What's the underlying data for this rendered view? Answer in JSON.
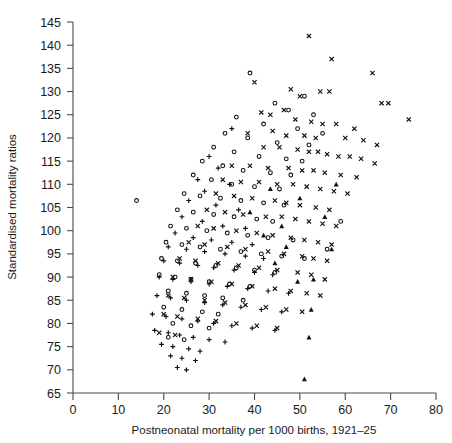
{
  "figure": {
    "clipped_top_caption": "",
    "background": "#ffffff",
    "marker_color": "#111111",
    "axis_color": "#4a4a4a"
  },
  "chart_data": {
    "type": "scatter",
    "title": "",
    "xlabel": "Postneonatal mortality per 1000 births, 1921–25",
    "ylabel": "Standardised mortality ratios",
    "xlim": [
      0,
      80
    ],
    "ylim": [
      65,
      145
    ],
    "xticks": [
      0,
      10,
      20,
      30,
      40,
      50,
      60,
      70,
      80
    ],
    "yticks": [
      65,
      70,
      75,
      80,
      85,
      90,
      95,
      100,
      105,
      110,
      115,
      120,
      125,
      130,
      135,
      140,
      145
    ],
    "grid": false,
    "legend": false,
    "series": [
      {
        "name": "cross",
        "marker": "x",
        "points": [
          [
            52.0,
            142.0
          ],
          [
            57.0,
            137.0
          ],
          [
            40.0,
            132.0
          ],
          [
            66.0,
            134.0
          ],
          [
            48.0,
            130.5
          ],
          [
            54.5,
            130.0
          ],
          [
            56.5,
            130.0
          ],
          [
            50.0,
            129.0
          ],
          [
            68.0,
            127.5
          ],
          [
            69.5,
            127.5
          ],
          [
            74.0,
            124.0
          ],
          [
            46.5,
            126.0
          ],
          [
            41.5,
            125.5
          ],
          [
            43.5,
            125.0
          ],
          [
            49.0,
            124.0
          ],
          [
            52.5,
            123.5
          ],
          [
            55.0,
            123.0
          ],
          [
            58.0,
            123.0
          ],
          [
            62.0,
            122.0
          ],
          [
            44.0,
            121.5
          ],
          [
            38.5,
            121.0
          ],
          [
            47.0,
            120.5
          ],
          [
            51.0,
            120.5
          ],
          [
            53.5,
            120.0
          ],
          [
            60.0,
            120.0
          ],
          [
            64.0,
            119.5
          ],
          [
            67.0,
            118.5
          ],
          [
            42.0,
            118.0
          ],
          [
            45.5,
            118.0
          ],
          [
            49.5,
            117.5
          ],
          [
            52.0,
            117.0
          ],
          [
            54.0,
            117.0
          ],
          [
            56.0,
            116.5
          ],
          [
            58.5,
            116.0
          ],
          [
            61.0,
            116.0
          ],
          [
            63.5,
            115.5
          ],
          [
            66.5,
            114.5
          ],
          [
            35.0,
            114.0
          ],
          [
            39.0,
            114.0
          ],
          [
            43.0,
            113.5
          ],
          [
            47.5,
            113.5
          ],
          [
            50.5,
            113.0
          ],
          [
            53.0,
            113.0
          ],
          [
            55.5,
            112.5
          ],
          [
            59.0,
            112.0
          ],
          [
            62.5,
            111.5
          ],
          [
            33.0,
            111.0
          ],
          [
            37.0,
            110.5
          ],
          [
            41.0,
            110.5
          ],
          [
            45.0,
            110.0
          ],
          [
            48.5,
            110.0
          ],
          [
            51.5,
            109.5
          ],
          [
            54.5,
            109.0
          ],
          [
            57.5,
            108.5
          ],
          [
            60.5,
            108.0
          ],
          [
            31.5,
            108.0
          ],
          [
            35.5,
            107.5
          ],
          [
            39.5,
            107.0
          ],
          [
            44.5,
            106.5
          ],
          [
            47.0,
            106.0
          ],
          [
            50.0,
            105.5
          ],
          [
            53.5,
            105.0
          ],
          [
            56.5,
            104.5
          ],
          [
            29.5,
            104.5
          ],
          [
            33.5,
            104.0
          ],
          [
            37.5,
            103.5
          ],
          [
            42.5,
            103.0
          ],
          [
            46.0,
            103.0
          ],
          [
            49.0,
            102.5
          ],
          [
            52.0,
            102.0
          ],
          [
            55.0,
            101.5
          ],
          [
            58.0,
            101.0
          ],
          [
            27.5,
            101.0
          ],
          [
            31.0,
            100.5
          ],
          [
            36.0,
            100.0
          ],
          [
            40.5,
            99.5
          ],
          [
            44.0,
            99.0
          ],
          [
            48.0,
            98.5
          ],
          [
            51.0,
            98.0
          ],
          [
            54.0,
            97.5
          ],
          [
            57.0,
            97.0
          ],
          [
            25.5,
            97.5
          ],
          [
            29.0,
            97.0
          ],
          [
            34.0,
            96.5
          ],
          [
            38.0,
            96.0
          ],
          [
            43.0,
            95.5
          ],
          [
            46.5,
            95.0
          ],
          [
            50.5,
            94.5
          ],
          [
            53.0,
            94.0
          ],
          [
            56.0,
            93.5
          ],
          [
            23.5,
            94.0
          ],
          [
            27.0,
            93.5
          ],
          [
            32.0,
            93.0
          ],
          [
            36.5,
            92.5
          ],
          [
            41.0,
            92.0
          ],
          [
            45.0,
            91.5
          ],
          [
            49.5,
            91.0
          ],
          [
            52.5,
            90.5
          ],
          [
            55.5,
            89.5
          ],
          [
            22.0,
            90.0
          ],
          [
            26.0,
            89.5
          ],
          [
            30.5,
            89.0
          ],
          [
            35.0,
            88.5
          ],
          [
            39.5,
            88.0
          ],
          [
            44.5,
            87.5
          ],
          [
            48.0,
            87.0
          ],
          [
            51.5,
            86.5
          ],
          [
            54.5,
            86.0
          ],
          [
            21.0,
            86.0
          ],
          [
            24.5,
            85.5
          ],
          [
            29.0,
            85.0
          ],
          [
            33.5,
            84.5
          ],
          [
            38.0,
            84.0
          ],
          [
            42.5,
            83.5
          ],
          [
            47.0,
            83.0
          ],
          [
            50.5,
            82.5
          ],
          [
            20.0,
            82.0
          ],
          [
            23.0,
            81.5
          ],
          [
            27.5,
            81.0
          ],
          [
            31.5,
            80.5
          ],
          [
            36.0,
            80.0
          ],
          [
            40.5,
            79.5
          ],
          [
            45.0,
            79.0
          ],
          [
            19.0,
            78.0
          ],
          [
            22.5,
            77.5
          ]
        ]
      },
      {
        "name": "circle",
        "marker": "o",
        "points": [
          [
            39.0,
            134.0
          ],
          [
            51.0,
            129.0
          ],
          [
            44.5,
            127.5
          ],
          [
            47.5,
            126.0
          ],
          [
            53.0,
            125.0
          ],
          [
            36.0,
            124.5
          ],
          [
            42.0,
            123.0
          ],
          [
            49.5,
            122.0
          ],
          [
            55.0,
            121.0
          ],
          [
            33.5,
            121.0
          ],
          [
            38.5,
            120.0
          ],
          [
            45.0,
            119.0
          ],
          [
            52.0,
            118.5
          ],
          [
            31.0,
            118.0
          ],
          [
            35.5,
            117.0
          ],
          [
            41.0,
            116.0
          ],
          [
            47.0,
            115.5
          ],
          [
            50.5,
            115.0
          ],
          [
            28.5,
            115.0
          ],
          [
            33.0,
            114.0
          ],
          [
            37.5,
            113.0
          ],
          [
            43.5,
            112.5
          ],
          [
            48.0,
            112.0
          ],
          [
            26.5,
            112.0
          ],
          [
            30.5,
            111.0
          ],
          [
            35.0,
            110.0
          ],
          [
            40.0,
            109.5
          ],
          [
            45.5,
            109.0
          ],
          [
            14.0,
            106.5
          ],
          [
            24.5,
            108.0
          ],
          [
            28.0,
            107.5
          ],
          [
            32.5,
            107.0
          ],
          [
            37.0,
            106.5
          ],
          [
            42.0,
            106.0
          ],
          [
            46.5,
            105.5
          ],
          [
            23.0,
            104.5
          ],
          [
            26.5,
            104.0
          ],
          [
            31.0,
            103.5
          ],
          [
            35.5,
            103.0
          ],
          [
            40.5,
            102.5
          ],
          [
            44.0,
            102.0
          ],
          [
            21.5,
            101.0
          ],
          [
            25.0,
            100.5
          ],
          [
            29.5,
            100.0
          ],
          [
            34.0,
            99.5
          ],
          [
            38.5,
            99.0
          ],
          [
            43.0,
            98.5
          ],
          [
            48.5,
            98.0
          ],
          [
            20.5,
            97.5
          ],
          [
            24.0,
            97.0
          ],
          [
            28.0,
            96.5
          ],
          [
            32.5,
            96.0
          ],
          [
            37.0,
            95.5
          ],
          [
            41.5,
            95.0
          ],
          [
            46.0,
            94.5
          ],
          [
            51.0,
            94.0
          ],
          [
            19.5,
            94.0
          ],
          [
            23.0,
            93.5
          ],
          [
            27.0,
            93.0
          ],
          [
            31.5,
            92.5
          ],
          [
            36.0,
            92.0
          ],
          [
            40.0,
            91.5
          ],
          [
            44.5,
            91.0
          ],
          [
            19.0,
            90.5
          ],
          [
            22.5,
            90.0
          ],
          [
            26.0,
            89.5
          ],
          [
            30.0,
            89.0
          ],
          [
            34.5,
            88.5
          ],
          [
            39.0,
            88.0
          ],
          [
            21.0,
            87.0
          ],
          [
            25.0,
            86.5
          ],
          [
            29.0,
            86.0
          ],
          [
            33.0,
            85.5
          ],
          [
            37.5,
            85.0
          ],
          [
            20.0,
            83.5
          ],
          [
            24.0,
            83.0
          ],
          [
            28.5,
            82.5
          ],
          [
            32.0,
            82.0
          ],
          [
            22.0,
            80.0
          ],
          [
            26.0,
            79.5
          ],
          [
            30.0,
            79.0
          ],
          [
            21.0,
            77.0
          ],
          [
            24.5,
            76.5
          ],
          [
            56.0,
            96.0
          ],
          [
            59.0,
            102.0
          ]
        ]
      },
      {
        "name": "plus",
        "marker": "+",
        "points": [
          [
            35.0,
            122.0
          ],
          [
            30.0,
            116.0
          ],
          [
            32.0,
            113.5
          ],
          [
            27.5,
            111.0
          ],
          [
            34.5,
            110.0
          ],
          [
            29.0,
            108.5
          ],
          [
            25.5,
            106.5
          ],
          [
            31.5,
            105.5
          ],
          [
            36.5,
            104.5
          ],
          [
            24.0,
            103.0
          ],
          [
            28.5,
            102.0
          ],
          [
            33.0,
            101.0
          ],
          [
            38.0,
            100.5
          ],
          [
            22.5,
            99.5
          ],
          [
            26.5,
            98.5
          ],
          [
            30.5,
            98.0
          ],
          [
            35.0,
            97.5
          ],
          [
            39.5,
            97.0
          ],
          [
            21.0,
            96.5
          ],
          [
            25.0,
            96.0
          ],
          [
            29.0,
            95.5
          ],
          [
            33.5,
            95.0
          ],
          [
            38.0,
            94.5
          ],
          [
            42.0,
            94.0
          ],
          [
            20.0,
            93.5
          ],
          [
            23.5,
            93.0
          ],
          [
            27.5,
            92.5
          ],
          [
            31.0,
            92.0
          ],
          [
            35.5,
            91.5
          ],
          [
            40.0,
            91.0
          ],
          [
            44.0,
            90.5
          ],
          [
            19.0,
            90.0
          ],
          [
            22.0,
            89.5
          ],
          [
            26.0,
            89.0
          ],
          [
            30.0,
            88.5
          ],
          [
            34.0,
            88.0
          ],
          [
            38.5,
            87.5
          ],
          [
            43.0,
            87.0
          ],
          [
            47.5,
            86.5
          ],
          [
            18.5,
            86.0
          ],
          [
            21.5,
            85.5
          ],
          [
            25.0,
            85.0
          ],
          [
            29.0,
            84.5
          ],
          [
            33.0,
            84.0
          ],
          [
            37.0,
            83.5
          ],
          [
            41.5,
            83.0
          ],
          [
            46.0,
            82.5
          ],
          [
            17.5,
            82.0
          ],
          [
            20.5,
            81.5
          ],
          [
            24.0,
            81.0
          ],
          [
            27.5,
            80.5
          ],
          [
            31.0,
            80.0
          ],
          [
            35.0,
            79.5
          ],
          [
            39.5,
            79.0
          ],
          [
            44.5,
            78.5
          ],
          [
            18.0,
            78.5
          ],
          [
            21.0,
            78.0
          ],
          [
            23.5,
            77.5
          ],
          [
            26.5,
            77.0
          ],
          [
            30.0,
            76.5
          ],
          [
            33.5,
            76.0
          ],
          [
            19.5,
            75.5
          ],
          [
            22.0,
            75.0
          ],
          [
            25.5,
            74.5
          ],
          [
            28.0,
            74.0
          ],
          [
            21.5,
            73.0
          ],
          [
            24.0,
            72.5
          ],
          [
            27.0,
            72.0
          ],
          [
            23.0,
            70.5
          ],
          [
            25.0,
            70.0
          ]
        ]
      },
      {
        "name": "triangle",
        "marker": "^",
        "points": [
          [
            51.0,
            68.0
          ],
          [
            52.0,
            77.0
          ],
          [
            52.5,
            83.0
          ],
          [
            49.5,
            89.0
          ],
          [
            53.0,
            89.5
          ],
          [
            44.5,
            93.0
          ],
          [
            47.0,
            96.5
          ],
          [
            57.0,
            96.0
          ],
          [
            42.0,
            99.0
          ],
          [
            46.0,
            101.0
          ],
          [
            55.5,
            103.0
          ],
          [
            39.0,
            104.0
          ],
          [
            50.0,
            107.0
          ],
          [
            43.5,
            109.0
          ],
          [
            58.0,
            110.0
          ]
        ]
      }
    ]
  },
  "axes": {
    "x_tick_labels": [
      "0",
      "10",
      "20",
      "30",
      "40",
      "50",
      "60",
      "70",
      "80"
    ],
    "y_tick_labels": [
      "65",
      "70",
      "75",
      "80",
      "85",
      "90",
      "95",
      "100",
      "105",
      "110",
      "115",
      "120",
      "125",
      "130",
      "135",
      "140",
      "145"
    ],
    "x_axis_title": "Postneonatal mortality per 1000 births, 1921–25",
    "y_axis_title": "Standardised mortality ratios"
  }
}
